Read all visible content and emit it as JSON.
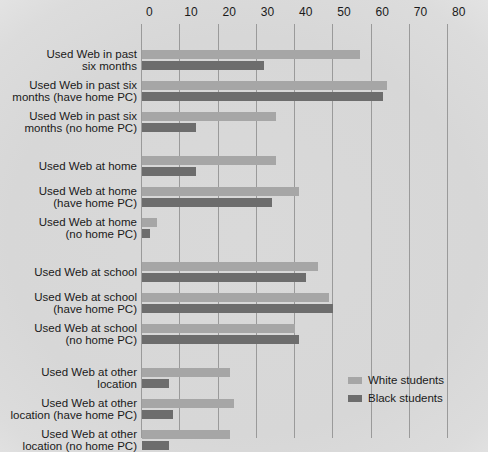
{
  "chart_data": {
    "type": "bar",
    "title": "",
    "subtitle": "",
    "xlabel": "",
    "ylabel": "",
    "orientation": "horizontal",
    "xlim": [
      0,
      80
    ],
    "xticks": [
      0,
      10,
      20,
      30,
      40,
      50,
      60,
      70,
      80
    ],
    "xtick_labels": [
      "0",
      "10",
      "20",
      "30",
      "40",
      "50",
      "60",
      "70",
      "80"
    ],
    "grid": true,
    "legend_position": "bottom-right",
    "colors": {
      "white_students": "#a6a6a6",
      "black_students": "#6d6d6d",
      "gridline": "#9a9a9a",
      "background": "#dcdcdc"
    },
    "categories": [
      "Used Web in past\nsix months",
      "Used Web in past six\nmonths (have home PC)",
      "Used Web in past six\nmonths (no home PC)",
      "Used Web at home",
      "Used Web at home\n(have home PC)",
      "Used Web at home\n(no home PC)",
      "Used Web at school",
      "Used Web at school\n(have home PC)",
      "Used Web at school\n(no home PC)",
      "Used Web at other\nlocation",
      "Used Web at other\nlocation (have home PC)",
      "Used Web at other\nlocation (no home PC)"
    ],
    "series": [
      {
        "name": "White students",
        "color": "#a6a6a6",
        "values": [
          57,
          64,
          35,
          35,
          41,
          4,
          46,
          49,
          40,
          23,
          24,
          23
        ]
      },
      {
        "name": "Black students",
        "color": "#6d6d6d",
        "values": [
          32,
          63,
          14,
          14,
          34,
          2,
          43,
          50,
          41,
          7,
          8,
          7
        ]
      }
    ]
  },
  "legend": {
    "items": [
      {
        "label": "White students",
        "key": "white"
      },
      {
        "label": "Black students",
        "key": "black"
      }
    ]
  }
}
